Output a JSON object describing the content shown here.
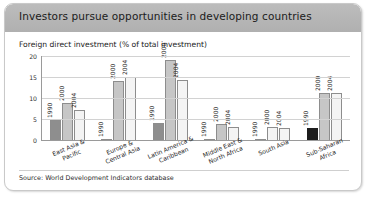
{
  "figure": {
    "title": "Investors pursue opportunities in developing countries",
    "subtitle": "Foreign direct investment (% of total investment)",
    "source": "Source: World Development Indicators database",
    "colors": {
      "title_bar": "#b4b4b4",
      "series_1990": "#8e8e8e",
      "series_2000": "#c6c6c6",
      "series_2004": "#f4f4f4",
      "series_1990_highlight": "#1d1d1d",
      "gridline": "#d2d2d2",
      "axis": "#9a9a9a",
      "panel": "#ffffff"
    }
  },
  "chart_data": {
    "type": "bar",
    "title": "Investors pursue opportunities in developing countries",
    "subtitle": "Foreign direct investment (% of total investment)",
    "xlabel": "",
    "ylabel": "",
    "ylim": [
      0,
      20
    ],
    "yticks": [
      0,
      5,
      10,
      15,
      20
    ],
    "ytick_labels": [
      "0",
      "5",
      "10",
      "15",
      "20"
    ],
    "grid": true,
    "legend": "none",
    "bar_value_labels": "year printed vertically inside/above each bar",
    "categories": [
      "East Asia &\nPacific",
      "Europe &\nCentral Asia",
      "Latin America &\nCaribbean",
      "Middle East &\nNorth Africa",
      "South Asia",
      "Sub-Saharan\nAfrica"
    ],
    "series": [
      {
        "name": "1990",
        "values": [
          4.7,
          0.3,
          4.0,
          0.2,
          0.3,
          2.8
        ]
      },
      {
        "name": "2000",
        "values": [
          8.7,
          14.0,
          19.1,
          3.7,
          3.0,
          11.1
        ]
      },
      {
        "name": "2004",
        "values": [
          7.1,
          15.0,
          14.2,
          3.2,
          2.8,
          11.2
        ]
      }
    ],
    "bars": [
      {
        "category": "East Asia & Pacific",
        "year": "1990",
        "value": 4.7,
        "style": "mid"
      },
      {
        "category": "East Asia & Pacific",
        "year": "2000",
        "value": 8.7,
        "style": "light"
      },
      {
        "category": "East Asia & Pacific",
        "year": "2004",
        "value": 7.1,
        "style": "white"
      },
      {
        "category": "Europe & Central Asia",
        "year": "1990",
        "value": 0.3,
        "style": "mid"
      },
      {
        "category": "Europe & Central Asia",
        "year": "2000",
        "value": 14.0,
        "style": "light"
      },
      {
        "category": "Europe & Central Asia",
        "year": "2004",
        "value": 15.0,
        "style": "white"
      },
      {
        "category": "Latin America & Caribbean",
        "year": "1990",
        "value": 4.0,
        "style": "mid"
      },
      {
        "category": "Latin America & Caribbean",
        "year": "2000",
        "value": 19.1,
        "style": "light"
      },
      {
        "category": "Latin America & Caribbean",
        "year": "2004",
        "value": 14.2,
        "style": "white"
      },
      {
        "category": "Middle East & North Africa",
        "year": "1990",
        "value": 0.2,
        "style": "mid"
      },
      {
        "category": "Middle East & North Africa",
        "year": "2000",
        "value": 3.7,
        "style": "light"
      },
      {
        "category": "Middle East & North Africa",
        "year": "2004",
        "value": 3.2,
        "style": "white"
      },
      {
        "category": "South Asia",
        "year": "1990",
        "value": 0.3,
        "style": "mid"
      },
      {
        "category": "South Asia",
        "year": "2000",
        "value": 3.0,
        "style": "white"
      },
      {
        "category": "South Asia",
        "year": "2004",
        "value": 2.8,
        "style": "white"
      },
      {
        "category": "Sub-Saharan Africa",
        "year": "1990",
        "value": 2.8,
        "style": "dark"
      },
      {
        "category": "Sub-Saharan Africa",
        "year": "2000",
        "value": 11.1,
        "style": "light"
      },
      {
        "category": "Sub-Saharan Africa",
        "year": "2004",
        "value": 11.2,
        "style": "white"
      }
    ]
  }
}
